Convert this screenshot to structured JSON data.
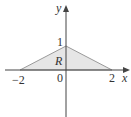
{
  "diagram": {
    "region_label": "R",
    "x_axis_label": "x",
    "y_axis_label": "y",
    "origin_label": "0",
    "x_ticks": [
      "−2",
      "2"
    ],
    "y_ticks": [
      "1"
    ],
    "vertices": [
      [
        -2,
        0
      ],
      [
        0,
        1
      ],
      [
        2,
        0
      ]
    ],
    "colors": {
      "fill": "#e6e6e6",
      "edge": "#9a9a9a",
      "axis": "#444444"
    }
  }
}
